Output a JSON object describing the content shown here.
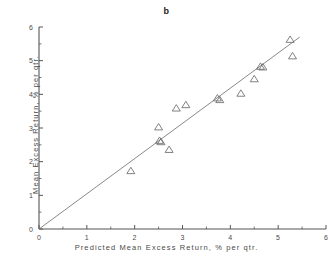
{
  "figure": {
    "panel_label": "b",
    "background_color": "#ffffff",
    "axis_color": "#555555",
    "marker_color": "#6b6b6b",
    "line_color": "#7a7a7a",
    "text_color": "#4a4a4a"
  },
  "chart_data": {
    "type": "scatter",
    "title": "b",
    "xlabel": "Predicted Mean Excess Return, % per qtr.",
    "ylabel": "Mean Excess Return, % per qtr.",
    "xlim": [
      0,
      6
    ],
    "ylim": [
      0,
      6
    ],
    "xticks": [
      0,
      1,
      2,
      3,
      4,
      5,
      6
    ],
    "yticks": [
      0,
      1,
      2,
      3,
      4,
      5,
      6
    ],
    "xtick_labels": [
      "0",
      "1",
      "2",
      "3",
      "4",
      "5",
      "6"
    ],
    "ytick_labels": [
      "0",
      "1",
      "2",
      "3",
      "4",
      "5",
      "6"
    ],
    "minor_tick_step": 0.5,
    "grid": false,
    "legend": null,
    "marker": "open-triangle",
    "points": [
      {
        "x": 1.92,
        "y": 1.72
      },
      {
        "x": 2.5,
        "y": 3.02
      },
      {
        "x": 2.52,
        "y": 2.62
      },
      {
        "x": 2.55,
        "y": 2.58
      },
      {
        "x": 2.72,
        "y": 2.35
      },
      {
        "x": 2.87,
        "y": 3.58
      },
      {
        "x": 3.07,
        "y": 3.68
      },
      {
        "x": 3.73,
        "y": 3.88
      },
      {
        "x": 3.78,
        "y": 3.83
      },
      {
        "x": 4.22,
        "y": 4.02
      },
      {
        "x": 4.5,
        "y": 4.45
      },
      {
        "x": 4.63,
        "y": 4.82
      },
      {
        "x": 4.68,
        "y": 4.8
      },
      {
        "x": 5.25,
        "y": 5.62
      },
      {
        "x": 5.3,
        "y": 5.13
      }
    ],
    "reference_line": {
      "description": "45-degree identity line",
      "x_start": 0.0,
      "y_start": 0.0,
      "x_end": 5.45,
      "y_end": 5.7
    }
  }
}
